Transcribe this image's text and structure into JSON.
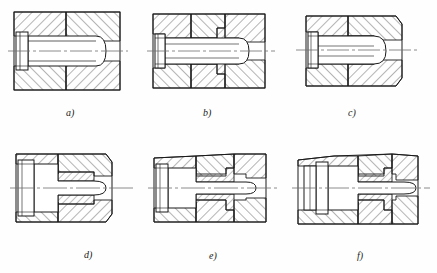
{
  "drawing": {
    "title": "Cross-sectional views of pin and housing assemblies",
    "sheet_background": "#fefefe",
    "line_color": "#1a1a1a",
    "hatch_color": "#2b2b2b",
    "centerline_color": "#6e6e6e",
    "panel_count": 6
  },
  "panels": [
    {
      "id": "a",
      "caption": "a)",
      "description": "Plain cylindrical pin with rounded nose seated in a one-piece hatched housing; left end has a stepped collar head.",
      "features": [
        "housing-block",
        "section-hatching",
        "center-line",
        "rounded-nose-pin",
        "left-collar-head"
      ]
    },
    {
      "id": "b",
      "caption": "b)",
      "description": "Pin with rounded nose in a three-part housing with an inner stepped sleeve bushing; stepped shoulder at mid-length.",
      "features": [
        "housing-block",
        "inner-sleeve",
        "section-hatching",
        "center-line",
        "rounded-nose-pin",
        "left-collar-head"
      ]
    },
    {
      "id": "c",
      "caption": "c)",
      "description": "Pin with rounded nose and short hatched bushing ring; outer housing has chamfered left and right faces.",
      "features": [
        "housing-block",
        "bushing-ring",
        "section-hatching",
        "center-line",
        "rounded-nose-pin",
        "chamfered-ends"
      ]
    },
    {
      "id": "d",
      "caption": "d)",
      "description": "Stepped pin of two diameters with rounded nose; short hatched bushing around the smaller diameter, housing open at left.",
      "features": [
        "housing-block",
        "bushing-ring",
        "section-hatching",
        "center-line",
        "rounded-nose-pin",
        "stepped-shaft"
      ]
    },
    {
      "id": "e",
      "caption": "e)",
      "description": "Stepped pin with rounded nose inside a long hatched sleeve; housing split into three hatched zones.",
      "features": [
        "housing-block",
        "long-sleeve",
        "section-hatching",
        "center-line",
        "rounded-nose-pin",
        "stepped-shaft"
      ]
    },
    {
      "id": "f",
      "caption": "f)",
      "description": "Stepped pin with rounded nose, wide flange collar at left, and keyed hatched sleeve with notch detail at mid-length.",
      "features": [
        "housing-block",
        "flange-collar",
        "keyed-sleeve",
        "section-hatching",
        "center-line",
        "rounded-nose-pin"
      ]
    }
  ],
  "captions": {
    "a": "a)",
    "b": "b)",
    "c": "c)",
    "d": "d)",
    "e": "e)",
    "f": "f)"
  }
}
